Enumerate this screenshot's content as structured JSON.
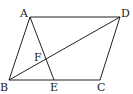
{
  "diagram": {
    "type": "geometry",
    "shape": "parallelogram ABCD",
    "points": {
      "A": {
        "x": 30,
        "y": 17
      },
      "B": {
        "x": 9,
        "y": 80
      },
      "C": {
        "x": 100,
        "y": 80
      },
      "D": {
        "x": 120,
        "y": 17
      },
      "E": {
        "x": 54,
        "y": 80
      },
      "F": {
        "x": 45,
        "y": 59
      }
    },
    "segments": [
      "AB",
      "BC",
      "CD",
      "DA",
      "AE",
      "BD"
    ],
    "labels": {
      "A": "A",
      "B": "B",
      "C": "C",
      "D": "D",
      "E": "E",
      "F": "F"
    },
    "line_color": "#222222"
  }
}
